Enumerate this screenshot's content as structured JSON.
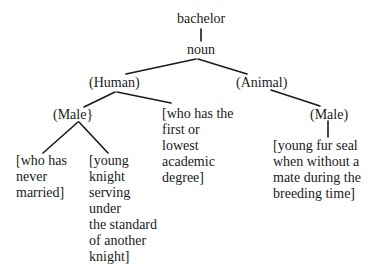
{
  "diagram": {
    "type": "semantic-tree",
    "root": "bachelor",
    "nodes": {
      "root": {
        "label": "bachelor"
      },
      "pos": {
        "label": "noun"
      },
      "human": {
        "label": "(Human)"
      },
      "animal": {
        "label": "(Animal)"
      },
      "human_male": {
        "label": "(Male}"
      },
      "animal_male": {
        "label": "(Male)"
      },
      "gloss_unmarried": {
        "lines": [
          "[who has",
          "never",
          "married]"
        ]
      },
      "gloss_knight": {
        "lines": [
          "[young",
          "knight",
          "serving",
          "under",
          "the standard",
          "of another",
          "knight]"
        ]
      },
      "gloss_degree": {
        "lines": [
          "[who has the",
          "first or",
          "lowest",
          "academic",
          "degree]"
        ]
      },
      "gloss_seal": {
        "lines": [
          "[young fur seal",
          "when without a",
          "mate during the",
          "breeding time]"
        ]
      }
    },
    "edges": [
      [
        "root",
        "pos"
      ],
      [
        "pos",
        "human"
      ],
      [
        "pos",
        "animal"
      ],
      [
        "human",
        "human_male"
      ],
      [
        "human",
        "gloss_degree"
      ],
      [
        "human_male",
        "gloss_unmarried"
      ],
      [
        "human_male",
        "gloss_knight"
      ],
      [
        "animal",
        "animal_male"
      ],
      [
        "animal_male",
        "gloss_seal"
      ]
    ],
    "line_color": "#1a1a1a"
  }
}
